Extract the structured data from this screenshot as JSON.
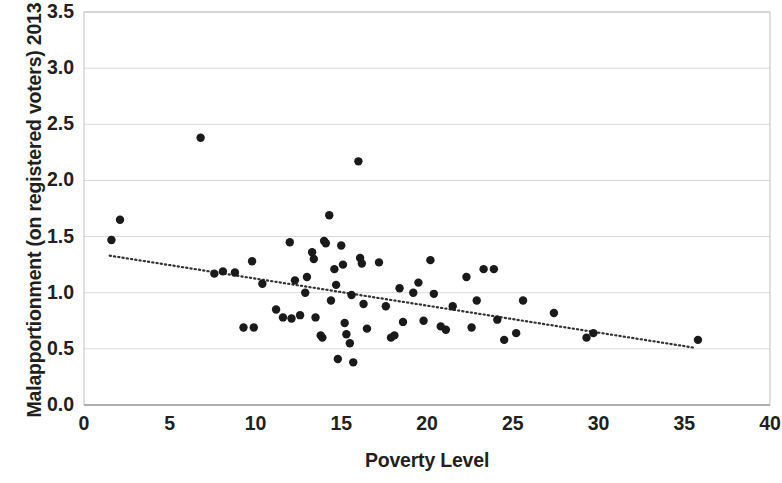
{
  "chart_data": {
    "type": "scatter",
    "title": "",
    "xlabel": "Poverty Level",
    "ylabel": "Malapportionment (on registered voters) 2013",
    "xlim": [
      0,
      40
    ],
    "ylim": [
      0.0,
      3.5
    ],
    "xticks": [
      "0",
      "5",
      "10",
      "15",
      "20",
      "25",
      "30",
      "35",
      "40"
    ],
    "xtick_values": [
      0,
      5,
      10,
      15,
      20,
      25,
      30,
      35,
      40
    ],
    "yticks": [
      "0.0",
      "0.5",
      "1.0",
      "1.5",
      "2.0",
      "2.5",
      "3.0",
      "3.5"
    ],
    "ytick_values": [
      0.0,
      0.5,
      1.0,
      1.5,
      2.0,
      2.5,
      3.0,
      3.5
    ],
    "grid": "horizontal",
    "legend": null,
    "marker_color": "#1a1a1a",
    "marker_size": 6,
    "gridline_color": "#d9d9d9",
    "axis_color": "#bfbfbf",
    "series": [
      {
        "name": "States",
        "marker": "circle",
        "points": [
          [
            1.6,
            1.47
          ],
          [
            2.1,
            1.65
          ],
          [
            6.8,
            2.38
          ],
          [
            7.6,
            1.17
          ],
          [
            8.1,
            1.19
          ],
          [
            8.8,
            1.18
          ],
          [
            9.3,
            0.69
          ],
          [
            9.8,
            1.28
          ],
          [
            9.9,
            0.69
          ],
          [
            10.4,
            1.08
          ],
          [
            11.2,
            0.85
          ],
          [
            11.6,
            0.78
          ],
          [
            12.0,
            1.45
          ],
          [
            12.1,
            0.77
          ],
          [
            12.3,
            1.11
          ],
          [
            12.6,
            0.8
          ],
          [
            12.9,
            1.0
          ],
          [
            13.0,
            1.14
          ],
          [
            13.3,
            1.36
          ],
          [
            13.4,
            1.3
          ],
          [
            13.5,
            0.78
          ],
          [
            13.8,
            0.62
          ],
          [
            13.9,
            0.6
          ],
          [
            14.0,
            1.46
          ],
          [
            14.1,
            1.44
          ],
          [
            14.3,
            1.69
          ],
          [
            14.4,
            0.93
          ],
          [
            14.6,
            1.21
          ],
          [
            14.7,
            1.07
          ],
          [
            14.8,
            0.41
          ],
          [
            15.0,
            1.42
          ],
          [
            15.1,
            1.25
          ],
          [
            15.2,
            0.73
          ],
          [
            15.3,
            0.63
          ],
          [
            15.5,
            0.55
          ],
          [
            15.6,
            0.98
          ],
          [
            15.7,
            0.38
          ],
          [
            16.0,
            2.17
          ],
          [
            16.1,
            1.31
          ],
          [
            16.2,
            1.26
          ],
          [
            16.3,
            0.9
          ],
          [
            16.5,
            0.68
          ],
          [
            17.2,
            1.27
          ],
          [
            17.6,
            0.88
          ],
          [
            17.9,
            0.6
          ],
          [
            18.1,
            0.62
          ],
          [
            18.4,
            1.04
          ],
          [
            18.6,
            0.74
          ],
          [
            19.2,
            1.0
          ],
          [
            19.5,
            1.09
          ],
          [
            19.8,
            0.75
          ],
          [
            20.2,
            1.29
          ],
          [
            20.4,
            0.99
          ],
          [
            20.8,
            0.7
          ],
          [
            21.1,
            0.67
          ],
          [
            21.5,
            0.88
          ],
          [
            22.3,
            1.14
          ],
          [
            22.6,
            0.69
          ],
          [
            22.9,
            0.93
          ],
          [
            23.3,
            1.21
          ],
          [
            23.9,
            1.21
          ],
          [
            24.1,
            0.76
          ],
          [
            24.5,
            0.58
          ],
          [
            25.2,
            0.64
          ],
          [
            25.6,
            0.93
          ],
          [
            27.4,
            0.82
          ],
          [
            29.3,
            0.6
          ],
          [
            29.7,
            0.64
          ],
          [
            35.8,
            0.58
          ]
        ]
      }
    ],
    "trendline": {
      "style": "dotted",
      "color": "#333333",
      "x_start": 1.5,
      "y_start": 1.33,
      "x_end": 35.6,
      "y_end": 0.51
    }
  }
}
